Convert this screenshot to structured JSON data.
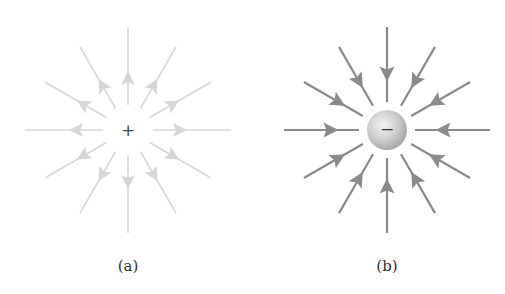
{
  "figure": {
    "panels": [
      {
        "id": "a",
        "label": "(a)",
        "charge_sign": "+",
        "charge_type": "positive",
        "field_direction": "outward",
        "line_color": "#d6d6d6",
        "sign_color": "#444444",
        "center": [
          128,
          130
        ],
        "label_pos": [
          128,
          257
        ],
        "line_count": 12,
        "has_sphere": false
      },
      {
        "id": "b",
        "label": "(b)",
        "charge_sign": "−",
        "charge_type": "negative",
        "field_direction": "inward",
        "line_color": "#8a8a8a",
        "sign_color": "#333333",
        "sphere_fill_light": "#f2f2f2",
        "sphere_fill_dark": "#a8a8a8",
        "center": [
          387,
          130
        ],
        "label_pos": [
          387,
          257
        ],
        "line_count": 12,
        "has_sphere": true
      }
    ]
  }
}
